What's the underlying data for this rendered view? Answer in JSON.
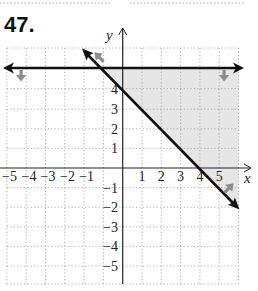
{
  "problem": {
    "number": "47."
  },
  "graph": {
    "x_axis_label": "x",
    "y_axis_label": "y",
    "x_ticks": [
      {
        "value": -5,
        "label": "−5"
      },
      {
        "value": -4,
        "label": "−4"
      },
      {
        "value": -3,
        "label": "−3"
      },
      {
        "value": -2,
        "label": "−2"
      },
      {
        "value": -1,
        "label": "−1"
      },
      {
        "value": 1,
        "label": "1"
      },
      {
        "value": 2,
        "label": "2"
      },
      {
        "value": 3,
        "label": "3"
      },
      {
        "value": 4,
        "label": "4"
      },
      {
        "value": 5,
        "label": "5"
      }
    ],
    "y_ticks": [
      {
        "value": 4,
        "label": "4"
      },
      {
        "value": 3,
        "label": "3"
      },
      {
        "value": 2,
        "label": "2"
      },
      {
        "value": 1,
        "label": "1"
      },
      {
        "value": -1,
        "label": "−1"
      },
      {
        "value": -2,
        "label": "−2"
      },
      {
        "value": -3,
        "label": "−3"
      },
      {
        "value": -4,
        "label": "−4"
      },
      {
        "value": -5,
        "label": "−5"
      }
    ],
    "x_range": [
      -6,
      6
    ],
    "y_range": [
      -5.9,
      6.1
    ],
    "boundary_lines": [
      {
        "equation": "y = 5",
        "style": "solid",
        "shade": "below"
      },
      {
        "equation": "y = -x + 4",
        "style": "solid",
        "shade": "above"
      }
    ],
    "shaded_region": "y ≤ 5 and y ≥ −x + 4",
    "colors": {
      "line": "#111111",
      "grid": "#9a9a9a",
      "shade": "#e6e6e6",
      "hint_arrow": "#8c8c8c"
    }
  }
}
